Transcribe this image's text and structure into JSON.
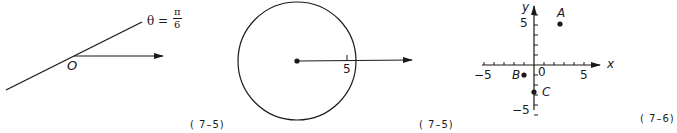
{
  "figures": [
    {
      "id": "fig1",
      "description": "Ray from origin O with a line at angle theta = pi/6",
      "origin_label": "O",
      "angle_label": "θ =",
      "angle_numerator": "π",
      "angle_denominator": "6",
      "caption": "( 7–5)"
    },
    {
      "id": "fig2",
      "description": "Circle centered at pole with radius 5 and polar axis ray",
      "radius_label": "5",
      "caption": "( 7–5)"
    },
    {
      "id": "fig3",
      "description": "Cartesian coordinate plane with points A, B, C",
      "x_axis_label": "x",
      "y_axis_label": "y",
      "origin_label": "0",
      "x_tick_labels": {
        "neg": "−5",
        "pos": "5"
      },
      "y_tick_labels": {
        "pos": "5",
        "neg": "−5"
      },
      "points": [
        {
          "label": "A",
          "x": 3,
          "y": 5
        },
        {
          "label": "B",
          "x": -1,
          "y": -1
        },
        {
          "label": "C",
          "x": 0,
          "y": -3
        }
      ],
      "caption": "( 7–6)"
    }
  ]
}
